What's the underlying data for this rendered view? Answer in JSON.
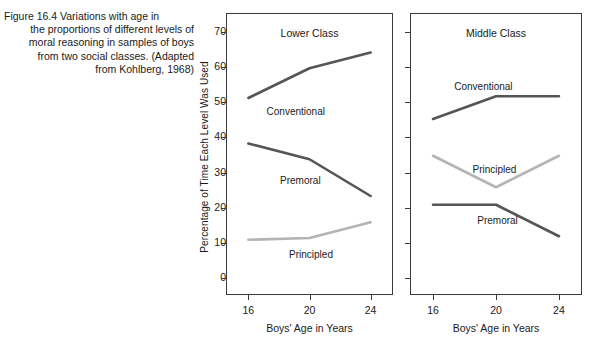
{
  "figure": {
    "caption_number": "Figure 16.4",
    "caption_lines": [
      "Figure 16.4    Variations with age in",
      "the proportions of different levels of",
      "moral reasoning in samples of boys",
      "from two social classes. (Adapted",
      "from Kohlberg, 1968)"
    ],
    "caption_text": "Figure 16.4    Variations with age in the proportions of different levels of moral reasoning in samples of boys from two social classes. (Adapted from Kohlberg, 1968)"
  },
  "colors": {
    "dark_line": "#555555",
    "light_line": "#b4b4b4",
    "axis": "#3b3b3b",
    "text": "#1a1a1a",
    "background": "#ffffff"
  },
  "axes": {
    "ylabel": "Percentage of Time Each Level Was Used",
    "xlabel": "Boys' Age in Years",
    "y_ticks": [
      0,
      10,
      20,
      30,
      40,
      50,
      60,
      70
    ],
    "y_tick_labels": [
      "0",
      "10",
      "20",
      "30",
      "40",
      "50",
      "60",
      "70"
    ],
    "ylim": [
      -5,
      75
    ],
    "x_ticks": [
      16,
      20,
      24
    ],
    "x_tick_labels": [
      "16",
      "20",
      "24"
    ],
    "xlim": [
      14.6,
      25.4
    ],
    "grid": false,
    "legend": "inline data labels"
  },
  "chart_data": {
    "type": "line",
    "xlabel": "Boys' Age in Years",
    "ylabel": "Percentage of Time Each Level Was Used",
    "x": [
      16,
      20,
      24
    ],
    "xlim": [
      14.6,
      25.4
    ],
    "ylim": [
      -5,
      75
    ],
    "grid": false,
    "legend": "inline",
    "panels": [
      {
        "id": "lower-class",
        "title": "Lower Class",
        "series": [
          {
            "name": "Conventional",
            "color": "#555555",
            "width": 2.6,
            "values": [
              51,
              59.5,
              64
            ],
            "label_x": 19.1,
            "label_y": 47.5
          },
          {
            "name": "Premoral",
            "color": "#555555",
            "width": 2.6,
            "values": [
              38,
              33.5,
              23
            ],
            "label_x": 19.4,
            "label_y": 28
          },
          {
            "name": "Principled",
            "color": "#b4b4b4",
            "width": 2.6,
            "values": [
              10.5,
              11,
              15.5
            ],
            "label_x": 20.1,
            "label_y": 7
          }
        ]
      },
      {
        "id": "middle-class",
        "title": "Middle Class",
        "series": [
          {
            "name": "Conventional",
            "color": "#555555",
            "width": 2.6,
            "values": [
              45,
              51.5,
              51.5
            ],
            "label_x": 19.2,
            "label_y": 54.5
          },
          {
            "name": "Principled",
            "color": "#b4b4b4",
            "width": 2.6,
            "values": [
              34.5,
              25.5,
              34.5
            ],
            "label_x": 19.9,
            "label_y": 31
          },
          {
            "name": "Premoral",
            "color": "#555555",
            "width": 2.6,
            "values": [
              20.5,
              20.5,
              11.5
            ],
            "label_x": 20.1,
            "label_y": 16.5
          }
        ]
      }
    ]
  }
}
